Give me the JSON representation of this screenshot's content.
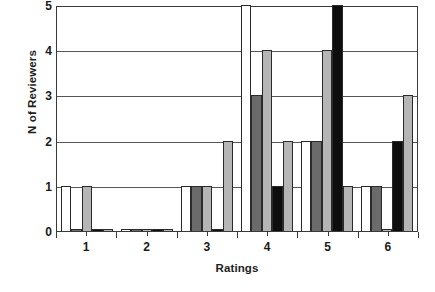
{
  "chart_data": {
    "type": "bar",
    "title": "",
    "xlabel": "Ratings",
    "ylabel": "N of Reviewers",
    "categories": [
      "1",
      "2",
      "3",
      "4",
      "5",
      "6"
    ],
    "ylim": [
      0,
      5
    ],
    "yticks": [
      0,
      1,
      2,
      3,
      4,
      5
    ],
    "xticks": [
      "1",
      "2",
      "3",
      "4",
      "5",
      "6"
    ],
    "grid": true,
    "legend": "none",
    "series": [
      {
        "name": "Series 1",
        "color": "#ffffff",
        "values": [
          1,
          0,
          1,
          5,
          2,
          1
        ]
      },
      {
        "name": "Series 2",
        "color": "#6b6b6b",
        "values": [
          0,
          0,
          1,
          3,
          2,
          1
        ]
      },
      {
        "name": "Series 3",
        "color": "#b5b5b5",
        "values": [
          1,
          0,
          1,
          4,
          4,
          0
        ]
      },
      {
        "name": "Series 4",
        "color": "#0d0d0d",
        "values": [
          0,
          0,
          0,
          1,
          5,
          2
        ]
      },
      {
        "name": "Series 5",
        "color": "#b5b5b5",
        "values": [
          0,
          0,
          2,
          2,
          1,
          3
        ]
      }
    ]
  },
  "axes": {
    "y_title": "N of Reviewers",
    "x_title": "Ratings",
    "y_tick_labels": [
      "0",
      "1",
      "2",
      "3",
      "4",
      "5"
    ],
    "x_tick_labels": [
      "1",
      "2",
      "3",
      "4",
      "5",
      "6"
    ]
  }
}
